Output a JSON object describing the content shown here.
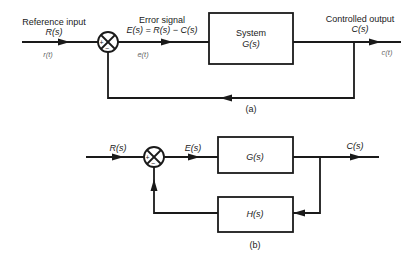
{
  "diagram_a": {
    "caption": "(a)",
    "input_label": "Reference input",
    "input_signal_s": "R(s)",
    "input_signal_t": "r(t)",
    "error_label": "Error signal",
    "error_equation": "E(s) = R(s) − C(s)",
    "error_signal_t": "e(t)",
    "system_label": "System",
    "system_tf": "G(s)",
    "output_label": "Controlled output",
    "output_signal_s": "C(s)",
    "output_signal_t": "c(t)",
    "plus_sign": "+",
    "minus_sign": "−"
  },
  "diagram_b": {
    "caption": "(b)",
    "input_signal_s": "R(s)",
    "error_signal_s": "E(s)",
    "forward_tf": "G(s)",
    "feedback_tf": "H(s)",
    "output_signal_s": "C(s)",
    "plus_sign": "+",
    "minus_sign": "−"
  }
}
